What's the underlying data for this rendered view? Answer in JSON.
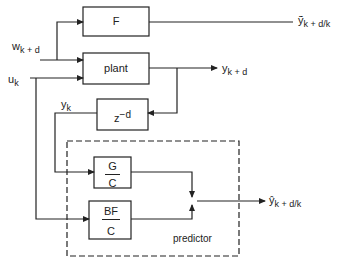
{
  "diagram": {
    "blocks": {
      "F": {
        "label": "F"
      },
      "plant": {
        "label": "plant"
      },
      "delay": {
        "label": "z",
        "exponent": "−d"
      },
      "G_over_C": {
        "numerator": "G",
        "denominator": "C"
      },
      "BF_over_C": {
        "numerator": "BF",
        "denominator": "C"
      },
      "predictor": {
        "label": "predictor"
      }
    },
    "signals": {
      "w_input": {
        "base": "w",
        "sub": "k + d"
      },
      "u_input": {
        "base": "u",
        "sub": "k"
      },
      "y_k": {
        "base": "y",
        "sub": "k"
      },
      "plant_output": {
        "base": "y",
        "sub": "k + d"
      },
      "F_output": {
        "base": "ỹ",
        "sub": "k + d/k"
      },
      "predictor_output": {
        "base": "ŷ",
        "sub": "k + d/k"
      }
    },
    "colors": {
      "line": "#222222",
      "background": "#ffffff"
    }
  }
}
